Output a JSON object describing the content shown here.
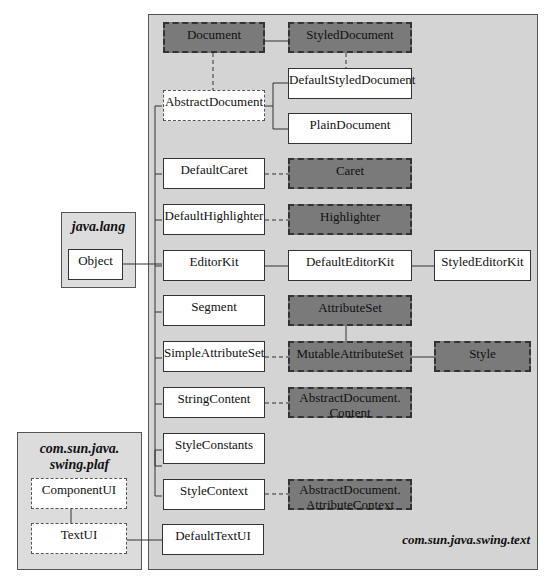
{
  "packages": {
    "text": {
      "name": "com.sun.java.swing.text"
    },
    "lang": {
      "name": "java.lang"
    },
    "plaf": {
      "name_line1": "com.sun.java.",
      "name_line2": "swing.plaf"
    }
  },
  "classes": {
    "document": "Document",
    "styled_document": "StyledDocument",
    "abstract_document": "AbstractDocument",
    "default_styled_document": "DefaultStyledDocument",
    "plain_document": "PlainDocument",
    "default_caret": "DefaultCaret",
    "caret": "Caret",
    "default_highlighter": "DefaultHighlighter",
    "highlighter": "Highlighter",
    "editor_kit": "EditorKit",
    "default_editor_kit": "DefaultEditorKit",
    "styled_editor_kit": "StyledEditorKit",
    "segment": "Segment",
    "attribute_set": "AttributeSet",
    "simple_attribute_set": "SimpleAttributeSet",
    "mutable_attribute_set": "MutableAttributeSet",
    "style": "Style",
    "string_content": "StringContent",
    "abstract_document_content_1": "AbstractDocument.",
    "abstract_document_content_2": "Content",
    "style_constants": "StyleConstants",
    "style_context": "StyleContext",
    "abstract_document_attribute_context_1": "AbstractDocument.",
    "abstract_document_attribute_context_2": "AttributeContext",
    "default_text_ui": "DefaultTextUI",
    "object": "Object",
    "component_ui": "ComponentUI",
    "text_ui": "TextUI"
  },
  "colors": {
    "package_bg": "#d4d4d4",
    "interface_fill": "#7a7a7a",
    "class_fill": "#ffffff"
  }
}
